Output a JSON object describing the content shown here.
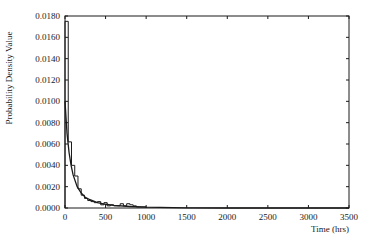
{
  "chart_data": {
    "type": "line",
    "title": "",
    "xlabel": "Time (hrs)",
    "ylabel": "Probability Density Value",
    "xlim": [
      0,
      3500
    ],
    "ylim": [
      0,
      0.018
    ],
    "grid": false,
    "legend": null,
    "x_ticks": [
      "0",
      "500",
      "1000",
      "1500",
      "2000",
      "2500",
      "3000",
      "3500"
    ],
    "y_ticks": [
      "0.0000",
      "0.0020",
      "0.0040",
      "0.0060",
      "0.0080",
      "0.0100",
      "0.0120",
      "0.0140",
      "0.0160",
      "0.0180"
    ],
    "series": [
      {
        "name": "Histogram (empirical density)",
        "style": "step",
        "x": [
          0,
          40,
          80,
          120,
          160,
          200,
          240,
          280,
          320,
          360,
          400,
          440,
          480,
          520,
          560,
          600,
          640,
          680,
          720,
          760,
          800,
          840,
          880,
          920,
          960,
          1000
        ],
        "values": [
          0.0175,
          0.0062,
          0.004,
          0.003,
          0.0018,
          0.0012,
          0.0009,
          0.0007,
          0.0006,
          0.0005,
          0.0006,
          0.0003,
          0.0005,
          0.0002,
          0.0003,
          0.0002,
          0.0002,
          0.0004,
          0.0002,
          0.0004,
          0.0003,
          0.0002,
          0.0001,
          0.0001,
          0.0001,
          0.0
        ]
      },
      {
        "name": "Fitted density curve",
        "style": "line",
        "x": [
          0,
          25,
          50,
          75,
          100,
          150,
          200,
          250,
          300,
          400,
          500,
          600,
          800,
          1000,
          1500,
          2000,
          2500,
          3000,
          3500
        ],
        "values": [
          0.01,
          0.007,
          0.0052,
          0.004,
          0.0031,
          0.002,
          0.0014,
          0.001,
          0.0008,
          0.0005,
          0.00035,
          0.00025,
          0.00014,
          8e-05,
          2e-05,
          0.0,
          0.0,
          0.0,
          0.0
        ]
      }
    ]
  }
}
